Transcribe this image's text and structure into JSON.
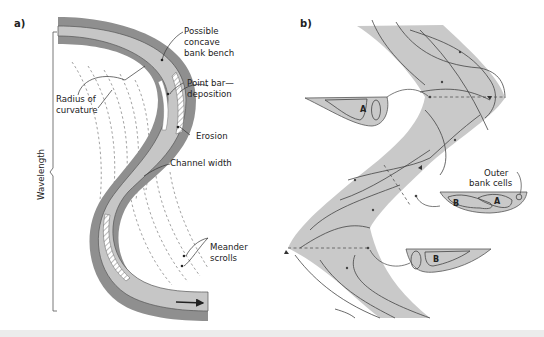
{
  "figure": {
    "panels": [
      {
        "id": "a",
        "label": "a)",
        "annotations": {
          "bank_bench_1": "Possible",
          "bank_bench_2": "concave",
          "bank_bench_3": "bank bench",
          "point_bar_1": "Point bar—",
          "point_bar_2": "deposition",
          "radius_1": "Radius of",
          "radius_2": "curvature",
          "erosion": "Erosion",
          "channel_width": "Channel width",
          "wavelength": "Wavelength",
          "scrolls_1": "Meander",
          "scrolls_2": "scrolls"
        },
        "flow_arrow": "arrow-right"
      },
      {
        "id": "b",
        "label": "b)",
        "annotations": {
          "cell_a_top": "A",
          "outer_1": "Outer",
          "outer_2": "bank cells",
          "cell_b_mid": "B",
          "cell_a_mid": "A",
          "cell_b_bottom": "B"
        }
      }
    ],
    "colors": {
      "bank_dark": "#8f8f8f",
      "channel_light": "#c4c4c4",
      "flow_fill": "#c9c9c9",
      "line": "#444444",
      "scroll_dash": "#8a8a8a",
      "bottom_band": "#ececec"
    }
  }
}
